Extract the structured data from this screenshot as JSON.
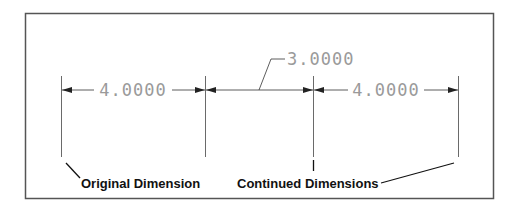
{
  "diagram": {
    "frame": {
      "x": 25,
      "y": 13,
      "width": 468,
      "height": 185,
      "stroke": "#555555"
    },
    "dimensions": [
      {
        "id": "original",
        "value": "4.0000",
        "x1": 61,
        "x2": 205,
        "text_x": 133
      },
      {
        "id": "continued-1",
        "value": "3.0000",
        "x1": 205,
        "x2": 313,
        "text_x": 318
      },
      {
        "id": "continued-2",
        "value": "4.0000",
        "x1": 313,
        "x2": 458,
        "text_x": 386
      }
    ],
    "labels": {
      "original": "Original Dimension",
      "continued": "Continued Dimensions"
    },
    "colors": {
      "line": "#333333",
      "dim_text": "#9a9a9a",
      "label_text": "#111111"
    }
  }
}
